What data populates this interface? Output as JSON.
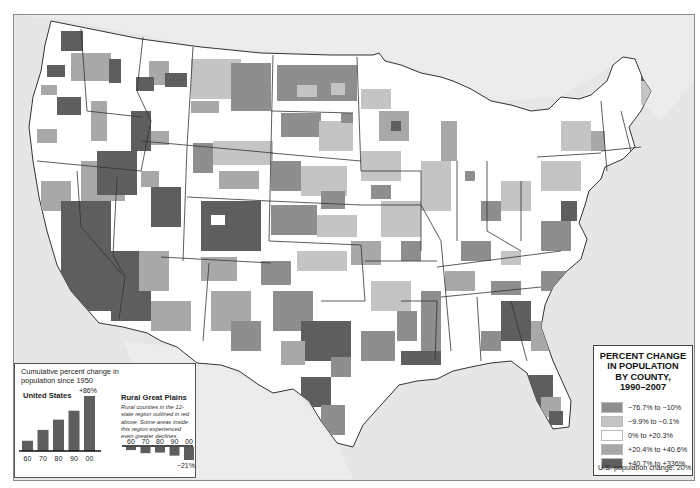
{
  "map": {
    "title": "Percent change in population by county, 1990–2007",
    "colors": {
      "ocean": "#e6e6e6",
      "land_outside": "#e9e9e9",
      "state_border": "#333333",
      "frame_border": "#8a8a8a"
    }
  },
  "legend": {
    "title_lines": [
      "PERCENT CHANGE",
      "IN POPULATION",
      "BY COUNTY,",
      "1990–2007"
    ],
    "items": [
      {
        "label": "−76.7% to −10%",
        "color": "#8e8e8e"
      },
      {
        "label": "−9.9% to −0.1%",
        "color": "#c4c4c4"
      },
      {
        "label": "0% to +20.3%",
        "color": "#ffffff"
      },
      {
        "label": "+20.4% to +40.6%",
        "color": "#a8a8a8"
      },
      {
        "label": "+40.7% to +336%",
        "color": "#5e5e5e"
      }
    ],
    "footer": "U.S. population change: 20%"
  },
  "inset": {
    "title": "Cumulative percent change in population since 1950",
    "us_label": "United States",
    "us_top_label": "+86%",
    "rural_label": "Rural Great Plains",
    "rural_note": "Rural counties in the 12-state region outlined in red above. Some areas inside this region experienced even greater declines.",
    "rural_bottom_label": "−21%",
    "bar_color": "#5e5e5e"
  },
  "chart_data": [
    {
      "type": "bar",
      "title": "United States",
      "subtitle": "Cumulative percent change in population since 1950",
      "categories": [
        "60",
        "70",
        "80",
        "90",
        "00"
      ],
      "values": [
        16,
        33,
        49,
        63,
        86
      ],
      "xlabel": "",
      "ylabel": "Cumulative % change",
      "annotations": [
        "+86%"
      ],
      "ylim": [
        0,
        90
      ]
    },
    {
      "type": "bar",
      "title": "Rural Great Plains",
      "subtitle": "Rural counties in the 12-state region outlined in red above. Some areas inside this region experienced even greater declines.",
      "categories": [
        "60",
        "70",
        "80",
        "90",
        "00"
      ],
      "values": [
        -5,
        -10,
        -9,
        -14,
        -21
      ],
      "xlabel": "",
      "ylabel": "Cumulative % change",
      "annotations": [
        "−21%"
      ],
      "ylim": [
        -25,
        0
      ]
    }
  ]
}
